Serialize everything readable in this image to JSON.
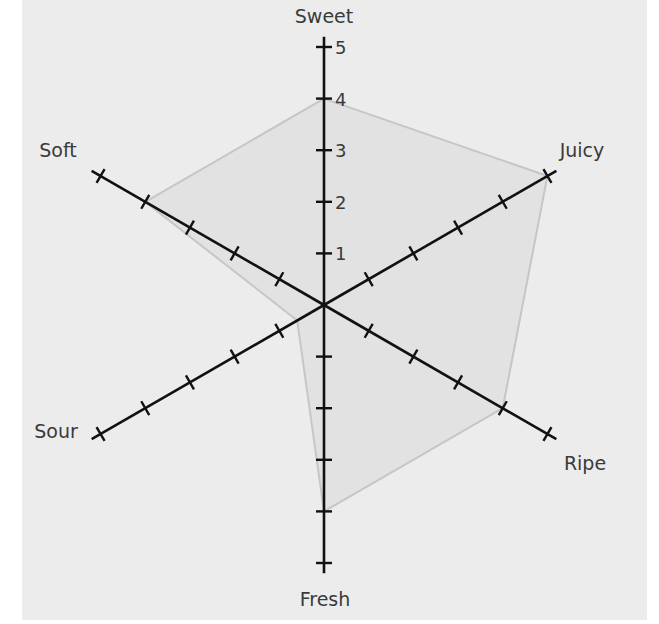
{
  "chart_data": {
    "type": "radar",
    "title": "",
    "axes": [
      "Sweet",
      "Juicy",
      "Ripe",
      "Fresh",
      "Sour",
      "Soft"
    ],
    "series": [
      {
        "name": "Profile",
        "values": [
          4,
          5,
          4,
          4,
          0.6,
          4
        ]
      }
    ],
    "scale": {
      "min": 0,
      "max": 5,
      "step": 1
    },
    "tick_labels": [
      "1",
      "2",
      "3",
      "4",
      "5"
    ],
    "tick_label_axis": "Sweet",
    "grid": false,
    "legend": "none"
  },
  "colors": {
    "background": "#ffffff",
    "panel": "#ececec",
    "fill": "#e2e2e2",
    "outline": "#c6c6c6",
    "axis": "#111111",
    "text": "#3a3a3a"
  },
  "geometry": {
    "cx": 324,
    "cy": 305,
    "unit": 51.6,
    "axis_extent": 5.2
  }
}
